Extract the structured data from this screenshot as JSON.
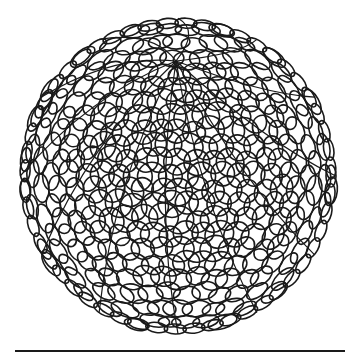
{
  "image": {
    "subject": "ink drawing of a sphere made of overlapping circles",
    "background": "#ffffff",
    "ink": "#1a1a1a"
  },
  "sphere": {
    "cx": 178,
    "cy": 176,
    "r": 161,
    "circle_radius": 13,
    "pole": {
      "x": 176,
      "y": 61
    }
  },
  "baseline": {
    "x1": 15,
    "x2": 345,
    "y": 351,
    "width": 2
  }
}
